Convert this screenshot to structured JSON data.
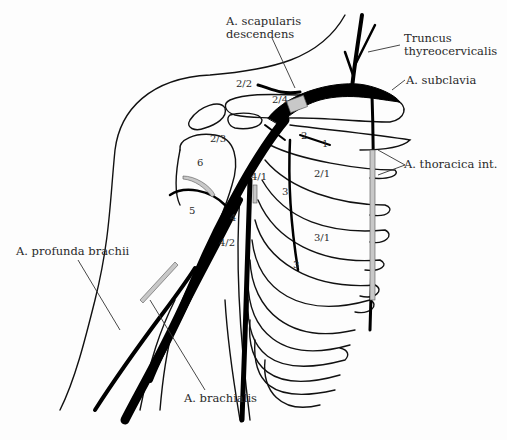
{
  "diagram": {
    "colors": {
      "line": "#111111",
      "vessel": "#000000",
      "ligated_segment": "#c8c8c8",
      "background": "#fdfdfd"
    },
    "labels": {
      "scapularis_line1": "A. scapularis",
      "scapularis_line2": "descendens",
      "truncus_line1": "Truncus",
      "truncus_line2": "thyreocervicalis",
      "subclavia": "A. subclavia",
      "thoracica": "A. thoracica int.",
      "profunda": "A. profunda brachii",
      "brachialis": "A. brachialis"
    },
    "numbers": [
      {
        "id": "n-2-2",
        "text": "2/2"
      },
      {
        "id": "n-2-4",
        "text": "2/4"
      },
      {
        "id": "n-2-3",
        "text": "2/3"
      },
      {
        "id": "n-2",
        "text": "2"
      },
      {
        "id": "n-1",
        "text": "1"
      },
      {
        "id": "n-6",
        "text": "6"
      },
      {
        "id": "n-2-1",
        "text": "2/1"
      },
      {
        "id": "n-4-1",
        "text": "4/1"
      },
      {
        "id": "n-3a",
        "text": "3"
      },
      {
        "id": "n-5",
        "text": "5"
      },
      {
        "id": "n-4",
        "text": "4"
      },
      {
        "id": "n-4-2",
        "text": "4/2"
      },
      {
        "id": "n-3-1",
        "text": "3/1"
      },
      {
        "id": "n-3b",
        "text": "3"
      }
    ]
  }
}
